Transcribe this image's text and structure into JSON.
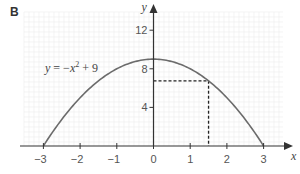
{
  "panel_label": "B",
  "chart_data": {
    "type": "line",
    "title": "",
    "annotation": {
      "equation_parts": [
        "y",
        " = −",
        "x",
        "2",
        " + 9"
      ],
      "equation_text": "y = −x² + 9"
    },
    "xlabel": "x",
    "ylabel": "y",
    "xlim": [
      -3.3,
      3.5
    ],
    "ylim": [
      0,
      13.8
    ],
    "xticks": [
      -3,
      -2,
      -1,
      0,
      1,
      2,
      3
    ],
    "xtick_labels": [
      "−3",
      "−2",
      "−1",
      "0",
      "1",
      "2",
      "3"
    ],
    "yticks": [
      4,
      8,
      12
    ],
    "ytick_labels": [
      "4",
      "8",
      "12"
    ],
    "grid": true,
    "series": [
      {
        "name": "y = −x² + 9",
        "function": "-x^2 + 9",
        "x_range": [
          -3,
          3
        ],
        "color": "#6b6b6b"
      }
    ],
    "dashed_guides": {
      "point": {
        "x": 1.5,
        "y": 6.75
      },
      "color": "#222222"
    },
    "colors": {
      "grid": "#ececec",
      "axis": "#333333"
    }
  }
}
